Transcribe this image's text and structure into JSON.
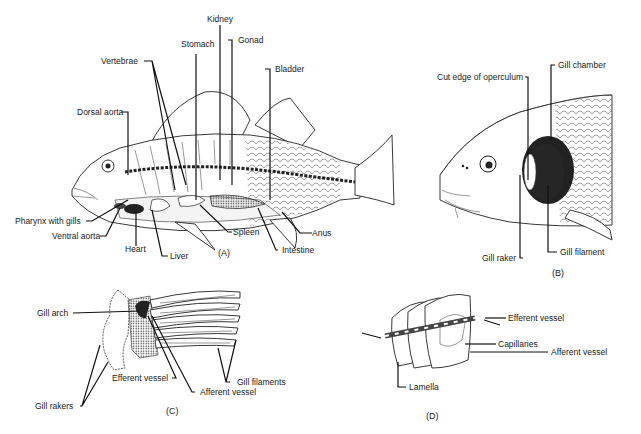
{
  "figure": {
    "panels": [
      {
        "id": "A",
        "label": "(A)",
        "subject": "perch internal anatomy",
        "labels": {
          "kidney": "Kidney",
          "gonad": "Gonad",
          "stomach": "Stomach",
          "vertebrae": "Vertebrae",
          "bladder": "Bladder",
          "dorsal_aorta": "Dorsal aorta",
          "pharynx": "Pharynx with gills",
          "ventral_aorta": "Ventral aorta",
          "heart": "Heart",
          "liver": "Liver",
          "spleen": "Spleen",
          "intestine": "Intestine",
          "anus": "Anus"
        }
      },
      {
        "id": "B",
        "label": "(B)",
        "subject": "fish head with operculum removed",
        "labels": {
          "cut_edge": "Cut edge of operculum",
          "gill_chamber": "Gill chamber",
          "gill_raker": "Gill raker",
          "gill_filament": "Gill filament"
        }
      },
      {
        "id": "C",
        "label": "(C)",
        "subject": "gill arch",
        "labels": {
          "gill_arch": "Gill arch",
          "efferent": "Efferent vessel",
          "afferent": "Afferent vessel",
          "gill_filaments": "Gill filaments",
          "gill_rakers": "Gill rakers"
        }
      },
      {
        "id": "D",
        "label": "(D)",
        "subject": "gill lamellae",
        "labels": {
          "efferent": "Efferent vessel",
          "capillaries": "Capillaries",
          "afferent": "Afferent vessel",
          "lamella": "Lamella"
        }
      }
    ]
  }
}
